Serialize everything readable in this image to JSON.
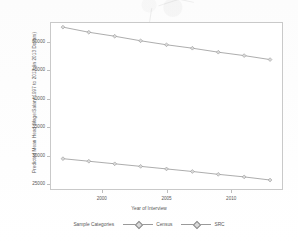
{
  "chart_data": {
    "type": "line",
    "title": "",
    "xlabel": "Year of Interview",
    "ylabel": "Predicted Mean Head Wage/Salary 1997 to 2013 (in 2013 Dollars)",
    "xlim": [
      1996,
      2014
    ],
    "ylim": [
      24000,
      53500
    ],
    "xticks": [
      2000,
      2005,
      2010
    ],
    "yticks": [
      25000,
      30000,
      35000,
      40000,
      45000,
      50000
    ],
    "ytick_labels": [
      "25000",
      "30000",
      "35000",
      "40000",
      "45000",
      "50000"
    ],
    "xtick_labels": [
      "2000",
      "2005",
      "2010"
    ],
    "grid": false,
    "legend_title": "Sample Categories",
    "legend_position": "bottom",
    "x": [
      1997,
      1999,
      2001,
      2003,
      2005,
      2007,
      2009,
      2011,
      2013
    ],
    "series": [
      {
        "name": "Census",
        "color": "#8a8a8a",
        "marker": "diamond",
        "values": [
          52600,
          51700,
          51000,
          50200,
          49500,
          48900,
          48200,
          47600,
          46900
        ]
      },
      {
        "name": "SRC",
        "color": "#8a8a8a",
        "marker": "diamond",
        "values": [
          29500,
          29050,
          28600,
          28150,
          27700,
          27250,
          26750,
          26300,
          25750
        ]
      }
    ]
  },
  "axis": {
    "y_title": "Predicted Mean Head Wage/Salary 1997 to 2013 (in 2013 Dollars)",
    "x_title": "Year of Interview"
  },
  "legend": {
    "title": "Sample Categories",
    "items": [
      {
        "label": "Census"
      },
      {
        "label": "SRC"
      }
    ]
  }
}
